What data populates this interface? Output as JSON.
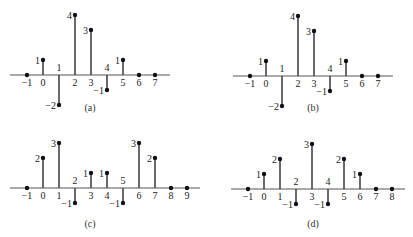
{
  "figure": {
    "captions": [
      "(a)",
      "(b)",
      "(c)",
      "(d)"
    ]
  },
  "chart_data": [
    {
      "type": "stem",
      "title": "(a)",
      "x": [
        -1,
        0,
        1,
        2,
        3,
        4,
        5,
        6,
        7
      ],
      "values": [
        0,
        1,
        -2,
        4,
        3,
        -1,
        1,
        0,
        0
      ],
      "xticks": [
        "−1",
        "0",
        "1",
        "2",
        "3",
        "4",
        "5",
        "6",
        "7"
      ],
      "xlabel": "",
      "ylabel": "",
      "grid": false
    },
    {
      "type": "stem",
      "title": "(b)",
      "x": [
        -1,
        0,
        1,
        2,
        3,
        4,
        5,
        6,
        7
      ],
      "values": [
        0,
        1,
        -2,
        4,
        3,
        -1,
        1,
        0,
        0
      ],
      "xticks": [
        "−1",
        "0",
        "1",
        "2",
        "3",
        "4",
        "5",
        "6",
        "7"
      ],
      "xlabel": "",
      "ylabel": "",
      "grid": false
    },
    {
      "type": "stem",
      "title": "(c)",
      "x": [
        -1,
        0,
        1,
        2,
        3,
        4,
        5,
        6,
        7,
        8,
        9
      ],
      "values": [
        0,
        2,
        3,
        -1,
        1,
        1,
        -1,
        3,
        2,
        0,
        0
      ],
      "xticks": [
        "−1",
        "0",
        "1",
        "2",
        "3",
        "4",
        "5",
        "6",
        "7",
        "8",
        "9"
      ],
      "xlabel": "",
      "ylabel": "",
      "grid": false
    },
    {
      "type": "stem",
      "title": "(d)",
      "x": [
        -1,
        0,
        1,
        2,
        3,
        4,
        5,
        6,
        7,
        8
      ],
      "values": [
        0,
        1,
        2,
        -1,
        3,
        -1,
        2,
        1,
        0,
        0
      ],
      "xticks": [
        "−1",
        "0",
        "1",
        "2",
        "3",
        "4",
        "5",
        "6",
        "7",
        "8"
      ],
      "xlabel": "",
      "ylabel": "",
      "grid": false
    }
  ]
}
